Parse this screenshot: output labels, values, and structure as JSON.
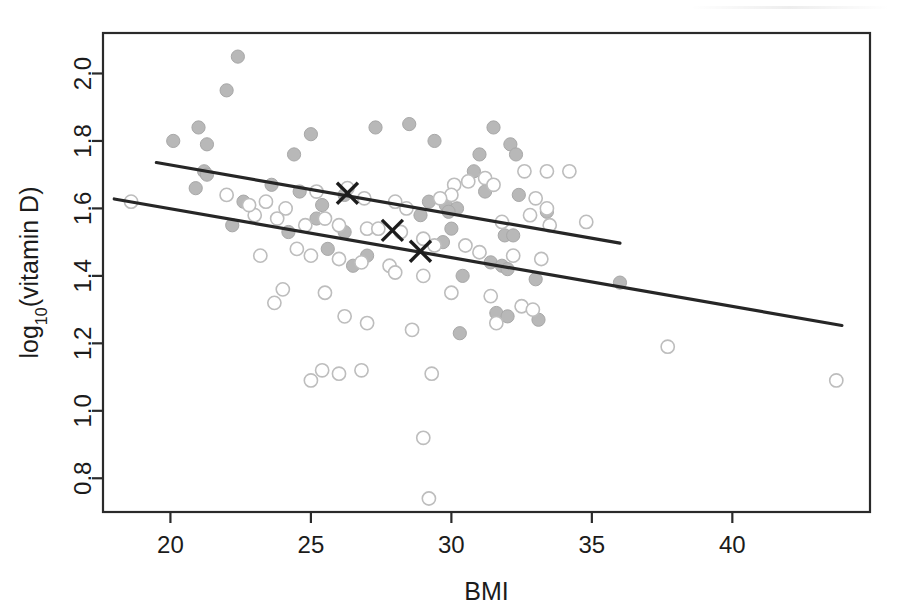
{
  "chart_data": {
    "type": "scatter",
    "title": "",
    "xlabel": "BMI",
    "ylabel": "log10(vitamin D)",
    "ylabel_base": "log",
    "ylabel_sub": "10",
    "ylabel_rest": "(vitamin D)",
    "xlim": [
      17.6,
      44.9
    ],
    "ylim": [
      0.7,
      2.12
    ],
    "xticks": [
      20,
      25,
      30,
      35,
      40
    ],
    "xticklabels": [
      "20",
      "25",
      "30",
      "35",
      "40"
    ],
    "yticks": [
      0.8,
      1.0,
      1.2,
      1.4,
      1.6,
      1.8,
      2.0
    ],
    "yticklabels": [
      "0.8",
      "1.0",
      "1.2",
      "1.4",
      "1.6",
      "1.8",
      "2.0"
    ],
    "grid": false,
    "legend": "none",
    "frame": "box",
    "colors": {
      "filled_point": "#b8b8b8",
      "open_point": "#ffffff",
      "open_point_stroke": "#bdbdbd",
      "line": "#262626",
      "axis": "#2a2a2a",
      "marker_x": "#1c1c1c",
      "background": "#ffffff"
    },
    "series": [
      {
        "name": "filled-group",
        "marker": "filled-circle",
        "points": [
          [
            22.4,
            2.05
          ],
          [
            22.0,
            1.95
          ],
          [
            21.0,
            1.84
          ],
          [
            20.1,
            1.8
          ],
          [
            21.3,
            1.79
          ],
          [
            25.0,
            1.82
          ],
          [
            27.3,
            1.84
          ],
          [
            28.5,
            1.85
          ],
          [
            31.5,
            1.84
          ],
          [
            29.4,
            1.8
          ],
          [
            32.1,
            1.79
          ],
          [
            31.0,
            1.76
          ],
          [
            32.3,
            1.76
          ],
          [
            24.4,
            1.76
          ],
          [
            30.8,
            1.71
          ],
          [
            21.2,
            1.71
          ],
          [
            21.3,
            1.7
          ],
          [
            23.6,
            1.67
          ],
          [
            20.9,
            1.66
          ],
          [
            24.6,
            1.65
          ],
          [
            26.2,
            1.64
          ],
          [
            31.2,
            1.65
          ],
          [
            32.4,
            1.64
          ],
          [
            22.6,
            1.62
          ],
          [
            25.4,
            1.61
          ],
          [
            29.8,
            1.61
          ],
          [
            30.2,
            1.6
          ],
          [
            29.9,
            1.59
          ],
          [
            33.4,
            1.59
          ],
          [
            22.2,
            1.55
          ],
          [
            30.0,
            1.54
          ],
          [
            26.2,
            1.53
          ],
          [
            24.2,
            1.53
          ],
          [
            31.9,
            1.52
          ],
          [
            32.2,
            1.52
          ],
          [
            29.7,
            1.5
          ],
          [
            25.6,
            1.48
          ],
          [
            27.0,
            1.46
          ],
          [
            31.4,
            1.44
          ],
          [
            31.8,
            1.43
          ],
          [
            32.0,
            1.42
          ],
          [
            26.5,
            1.43
          ],
          [
            30.4,
            1.4
          ],
          [
            33.0,
            1.39
          ],
          [
            36.0,
            1.38
          ],
          [
            31.6,
            1.29
          ],
          [
            32.0,
            1.28
          ],
          [
            30.3,
            1.23
          ],
          [
            33.1,
            1.27
          ],
          [
            25.2,
            1.57
          ],
          [
            28.9,
            1.58
          ],
          [
            29.2,
            1.62
          ]
        ]
      },
      {
        "name": "open-group",
        "marker": "open-circle",
        "points": [
          [
            18.6,
            1.62
          ],
          [
            22.0,
            1.64
          ],
          [
            23.4,
            1.62
          ],
          [
            24.1,
            1.6
          ],
          [
            23.8,
            1.57
          ],
          [
            25.2,
            1.65
          ],
          [
            26.3,
            1.66
          ],
          [
            26.9,
            1.63
          ],
          [
            28.0,
            1.62
          ],
          [
            28.4,
            1.6
          ],
          [
            30.1,
            1.67
          ],
          [
            30.6,
            1.68
          ],
          [
            31.2,
            1.69
          ],
          [
            32.6,
            1.71
          ],
          [
            33.4,
            1.71
          ],
          [
            34.2,
            1.71
          ],
          [
            33.0,
            1.63
          ],
          [
            33.4,
            1.6
          ],
          [
            31.5,
            1.67
          ],
          [
            32.8,
            1.58
          ],
          [
            30.0,
            1.64
          ],
          [
            29.6,
            1.63
          ],
          [
            31.8,
            1.56
          ],
          [
            33.5,
            1.55
          ],
          [
            25.5,
            1.57
          ],
          [
            26.0,
            1.55
          ],
          [
            24.8,
            1.55
          ],
          [
            27.0,
            1.54
          ],
          [
            27.4,
            1.54
          ],
          [
            28.2,
            1.53
          ],
          [
            29.0,
            1.51
          ],
          [
            29.4,
            1.49
          ],
          [
            30.5,
            1.49
          ],
          [
            31.0,
            1.47
          ],
          [
            32.2,
            1.46
          ],
          [
            33.2,
            1.45
          ],
          [
            24.5,
            1.48
          ],
          [
            25.0,
            1.46
          ],
          [
            26.0,
            1.45
          ],
          [
            26.8,
            1.44
          ],
          [
            27.8,
            1.43
          ],
          [
            23.2,
            1.46
          ],
          [
            28.0,
            1.41
          ],
          [
            29.0,
            1.4
          ],
          [
            24.0,
            1.36
          ],
          [
            25.5,
            1.35
          ],
          [
            30.0,
            1.35
          ],
          [
            31.4,
            1.34
          ],
          [
            32.5,
            1.31
          ],
          [
            32.9,
            1.3
          ],
          [
            23.7,
            1.32
          ],
          [
            26.2,
            1.28
          ],
          [
            27.0,
            1.26
          ],
          [
            28.6,
            1.24
          ],
          [
            31.6,
            1.26
          ],
          [
            25.4,
            1.12
          ],
          [
            26.8,
            1.12
          ],
          [
            26.0,
            1.11
          ],
          [
            29.3,
            1.11
          ],
          [
            25.0,
            1.09
          ],
          [
            29.0,
            0.92
          ],
          [
            29.2,
            0.74
          ],
          [
            37.7,
            1.19
          ],
          [
            43.7,
            1.09
          ],
          [
            34.8,
            1.56
          ],
          [
            23.0,
            1.58
          ],
          [
            22.8,
            1.61
          ]
        ]
      }
    ],
    "lines": [
      {
        "name": "upper-regression-line",
        "x": [
          19.5,
          36.0
        ],
        "y": [
          1.736,
          1.497
        ]
      },
      {
        "name": "lower-regression-line",
        "x": [
          18.0,
          43.9
        ],
        "y": [
          1.628,
          1.253
        ]
      }
    ],
    "markers": [
      {
        "name": "mean-marker-upper",
        "x": 26.3,
        "y": 1.645,
        "symbol": "x"
      },
      {
        "name": "mean-marker-middle",
        "x": 27.9,
        "y": 1.535,
        "symbol": "x"
      },
      {
        "name": "mean-marker-lower",
        "x": 28.9,
        "y": 1.473,
        "symbol": "x"
      }
    ]
  }
}
